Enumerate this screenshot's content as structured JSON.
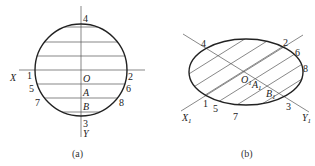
{
  "figure_a": {
    "caption": "(a)",
    "axis_labels": {
      "x": "X",
      "y": "Y"
    },
    "center_label": "O",
    "point_labels": {
      "A": "A",
      "B": "B"
    },
    "numbers": [
      "1",
      "2",
      "3",
      "4",
      "5",
      "6",
      "7",
      "8"
    ],
    "hatch_lines": 6
  },
  "figure_b": {
    "caption": "(b)",
    "axis_labels": {
      "x": "X",
      "x_sub": "1",
      "y": "Y",
      "y_sub": "1"
    },
    "center_label": "O",
    "center_sub": "1",
    "point_labels": {
      "A": "A",
      "A_sub": "1",
      "B": "B",
      "B_sub": "1"
    },
    "numbers": [
      "1",
      "2",
      "3",
      "4",
      "5",
      "6",
      "7",
      "8"
    ],
    "hatch_lines": 7
  },
  "colors": {
    "stroke": "#222222",
    "thin": "#555555",
    "background": "#ffffff"
  }
}
